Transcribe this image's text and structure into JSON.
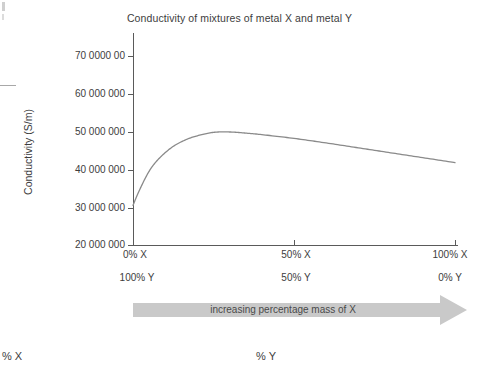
{
  "chart_data": {
    "type": "line",
    "title": "Conductivity of mixtures of metal X and metal Y",
    "xlabel": "",
    "ylabel": "Conductivity (S/m)",
    "ylim": [
      20000000,
      70000000
    ],
    "xlim": [
      0,
      100
    ],
    "grid": false,
    "legend": "none",
    "ytick_labels": [
      "70 0000 00",
      "60 000 000",
      "50 000 000",
      "40 000 000",
      "30 000 000",
      "20 000 000"
    ],
    "ytick_values": [
      70000000,
      60000000,
      50000000,
      40000000,
      30000000,
      20000000
    ],
    "xtick_values": [
      0,
      50,
      100
    ],
    "xtick_labels_primary": [
      "0% X",
      "50% X",
      "100% X"
    ],
    "xtick_labels_secondary": [
      "100% Y",
      "50% Y",
      "0% Y"
    ],
    "series": [
      {
        "name": "conductivity",
        "color": "#8a8a8a",
        "x": [
          0,
          2,
          5,
          8,
          12,
          16,
          20,
          25,
          30,
          35,
          40,
          50,
          60,
          70,
          80,
          90,
          100
        ],
        "values": [
          30500000,
          34500000,
          39500000,
          42800000,
          45800000,
          47700000,
          48900000,
          49800000,
          49900000,
          49600000,
          49200000,
          48200000,
          47000000,
          45700000,
          44400000,
          43100000,
          41800000
        ]
      }
    ],
    "annotations": [
      {
        "name": "increasing-mass-arrow",
        "text": "increasing percentage mass of X",
        "direction": "right",
        "color": "#c9c9c9"
      }
    ]
  },
  "page": {
    "bottom_captions": {
      "left": "% X",
      "middle": "% Y"
    }
  }
}
